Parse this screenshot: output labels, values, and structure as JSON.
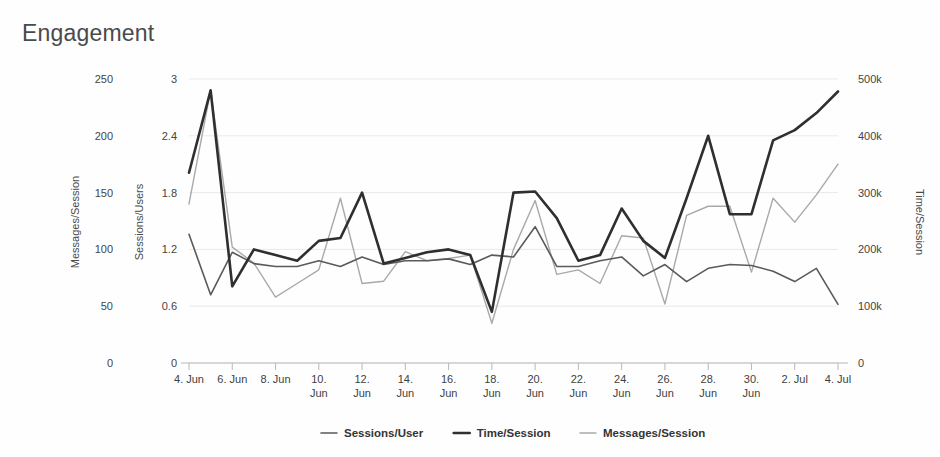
{
  "title": "Engagement",
  "legend": {
    "position": "bottom",
    "items": [
      {
        "label": "Sessions/User",
        "color": "#5a5a5a",
        "width": 1.6
      },
      {
        "label": "Time/Session",
        "color": "#2f2f2f",
        "width": 2.6
      },
      {
        "label": "Messages/Session",
        "color": "#a9a9a9",
        "width": 1.4
      }
    ]
  },
  "axes": {
    "left_outer": {
      "label": "Messages/Session",
      "ticks": [
        "0",
        "50",
        "100",
        "150",
        "200",
        "250"
      ],
      "min": 0,
      "max": 250
    },
    "left_inner": {
      "label": "Sessions/Users",
      "ticks": [
        "0",
        "0.6",
        "1.2",
        "1.8",
        "2.4",
        "3"
      ],
      "min": 0,
      "max": 3
    },
    "right": {
      "label": "Time/Session",
      "ticks": [
        "0",
        "100k",
        "200k",
        "300k",
        "400k",
        "500k"
      ],
      "min": 0,
      "max": 500000
    },
    "x": {
      "labels": [
        "4. Jun",
        "6. Jun",
        "8. Jun",
        "10. Jun",
        "12. Jun",
        "14. Jun",
        "16. Jun",
        "18. Jun",
        "20. Jun",
        "22. Jun",
        "24. Jun",
        "26. Jun",
        "28. Jun",
        "30. Jun",
        "2. Jul",
        "4. Jul"
      ]
    }
  },
  "chart_data": {
    "type": "line",
    "title": "Engagement",
    "xlabel": "",
    "ylabel": "Messages/Session, Sessions/Users",
    "y2label": "Time/Session",
    "grid": true,
    "legend_position": "bottom",
    "x": [
      "4. Jun",
      "5. Jun",
      "6. Jun",
      "7. Jun",
      "8. Jun",
      "9. Jun",
      "10. Jun",
      "11. Jun",
      "12. Jun",
      "13. Jun",
      "14. Jun",
      "15. Jun",
      "16. Jun",
      "17. Jun",
      "18. Jun",
      "19. Jun",
      "20. Jun",
      "21. Jun",
      "22. Jun",
      "23. Jun",
      "24. Jun",
      "25. Jun",
      "26. Jun",
      "27. Jun",
      "28. Jun",
      "29. Jun",
      "30. Jun",
      "1. Jul",
      "2. Jul",
      "3. Jul",
      "4. Jul"
    ],
    "series": [
      {
        "name": "Time/Session",
        "axis": "right",
        "unit": "s",
        "color": "#2f2f2f",
        "ylim": [
          0,
          500000
        ],
        "values": [
          335000,
          480000,
          135000,
          200000,
          190000,
          180000,
          215000,
          220000,
          300000,
          175000,
          185000,
          195000,
          200000,
          190000,
          90000,
          300000,
          302000,
          255000,
          180000,
          190000,
          272000,
          215000,
          185000,
          290000,
          400000,
          262000,
          262000,
          392000,
          410000,
          440000,
          478000
        ]
      },
      {
        "name": "Sessions/User",
        "axis": "left_inner",
        "color": "#5a5a5a",
        "ylim": [
          0,
          3
        ],
        "values": [
          1.36,
          0.72,
          1.17,
          1.05,
          1.02,
          1.02,
          1.08,
          1.02,
          1.12,
          1.04,
          1.08,
          1.08,
          1.1,
          1.04,
          1.14,
          1.12,
          1.44,
          1.02,
          1.02,
          1.08,
          1.12,
          0.92,
          1.04,
          0.86,
          1.0,
          1.04,
          1.03,
          0.97,
          0.86,
          1.0,
          0.62
        ]
      },
      {
        "name": "Messages/Session",
        "axis": "left_outer",
        "color": "#a9a9a9",
        "ylim": [
          0,
          250
        ],
        "values": [
          140,
          240,
          102,
          88,
          58,
          70,
          82,
          145,
          70,
          72,
          98,
          90,
          92,
          95,
          35,
          100,
          143,
          78,
          82,
          70,
          112,
          110,
          52,
          130,
          138,
          138,
          80,
          145,
          124,
          148,
          175
        ]
      }
    ]
  },
  "geometry": {
    "plot_left": 189,
    "plot_right": 838,
    "plot_top": 79,
    "plot_bottom": 363
  }
}
